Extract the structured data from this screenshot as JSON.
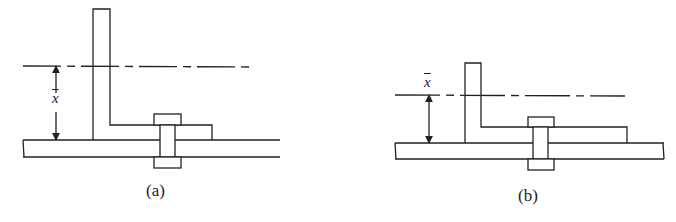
{
  "figures": [
    {
      "id": "a",
      "caption": "(a)",
      "dimension_label": "x",
      "description": "Angle bolted to plate, centroid distance x-bar measured from plate top to neutral axis"
    },
    {
      "id": "b",
      "caption": "(b)",
      "dimension_label": "x",
      "description": "Shorter angle bolted to plate, smaller x-bar"
    }
  ],
  "colors": {
    "stroke": "#222222",
    "background": "#ffffff"
  }
}
